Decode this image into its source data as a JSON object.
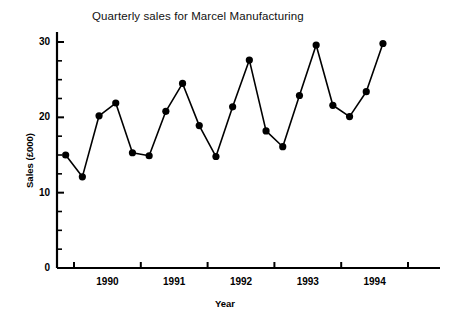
{
  "chart_data": {
    "type": "line",
    "title": "Quarterly sales for Marcel Manufacturing",
    "xlabel": "Year",
    "ylabel": "Sales (£000)",
    "ylim": [
      0,
      31
    ],
    "xlim": [
      1989.75,
      1994.75
    ],
    "grid": false,
    "legend": null,
    "marker": "filled-circle",
    "y_ticks_major": [
      0,
      10,
      20,
      30
    ],
    "y_tick_labels": [
      "0",
      "10",
      "20",
      "30"
    ],
    "y_ticks_minor": [
      2.5,
      5,
      7.5,
      12.5,
      15,
      17.5,
      22.5,
      25,
      27.5
    ],
    "x_ticks": [
      1990,
      1991,
      1992,
      1993,
      1994,
      1995
    ],
    "x_tick_labels": [
      "1990",
      "1991",
      "1992",
      "1993",
      "1994"
    ],
    "x_tick_label_positions": [
      1990.5,
      1991.5,
      1992.5,
      1993.5,
      1994.5
    ],
    "x": [
      1989.875,
      1990.125,
      1990.375,
      1990.625,
      1990.875,
      1991.125,
      1991.375,
      1991.625,
      1991.875,
      1992.125,
      1992.375,
      1992.625,
      1992.875,
      1993.125,
      1993.375,
      1993.625,
      1993.875,
      1994.125,
      1994.375,
      1994.625
    ],
    "categories": [
      "1990 Q1",
      "1990 Q2",
      "1990 Q3",
      "1990 Q4",
      "1991 Q1",
      "1991 Q2",
      "1991 Q3",
      "1991 Q4",
      "1992 Q1",
      "1992 Q2",
      "1992 Q3",
      "1992 Q4",
      "1993 Q1",
      "1993 Q2",
      "1993 Q3",
      "1993 Q4",
      "1994 Q1",
      "1994 Q2",
      "1994 Q3",
      "1994 Q4"
    ],
    "values": [
      15.0,
      12.1,
      20.2,
      21.9,
      15.3,
      14.9,
      20.8,
      24.5,
      18.9,
      14.8,
      21.4,
      27.6,
      18.2,
      16.1,
      22.9,
      29.6,
      21.6,
      20.1,
      23.4,
      29.8
    ],
    "series": [
      {
        "name": "Sales (£000)",
        "values": [
          15.0,
          12.1,
          20.2,
          21.9,
          15.3,
          14.9,
          20.8,
          24.5,
          18.9,
          14.8,
          21.4,
          27.6,
          18.2,
          16.1,
          22.9,
          29.6,
          21.6,
          20.1,
          23.4,
          29.8
        ]
      }
    ],
    "line_color": "#000000",
    "marker_color": "#000000",
    "background_color": "#ffffff"
  }
}
